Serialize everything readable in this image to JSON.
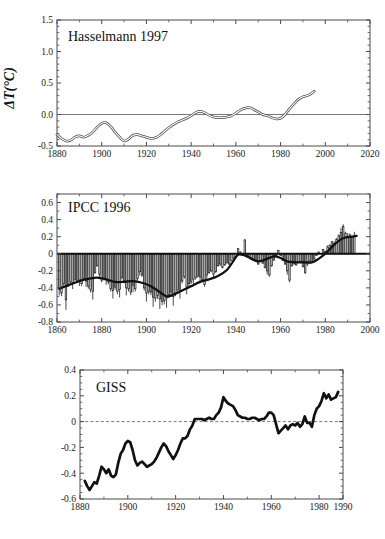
{
  "figure": {
    "background": "#ffffff",
    "panel_count": 3
  },
  "chart_data": [
    {
      "type": "line",
      "id": "hasselmann",
      "title": "Hasselmann 1997",
      "xlabel": "",
      "ylabel": "ΔT(°C)",
      "xlim": [
        1880,
        2020
      ],
      "ylim": [
        -0.5,
        1.5
      ],
      "xticks": [
        1880,
        1900,
        1920,
        1940,
        1960,
        1980,
        2000,
        2020
      ],
      "xtick_labels": [
        "1880",
        "1900",
        "1920",
        "1940",
        "1960",
        "1980",
        "2000",
        "2020"
      ],
      "yticks": [
        -0.5,
        0.0,
        0.5,
        1.0,
        1.5
      ],
      "ytick_labels": [
        "-0.5",
        "0.0",
        "0.5",
        "1.0",
        "1.5"
      ],
      "grid": false,
      "zero_line": true,
      "zero_line_style": "solid",
      "line_style": "hollow-double",
      "x": [
        1880,
        1882,
        1884,
        1886,
        1888,
        1890,
        1892,
        1894,
        1896,
        1898,
        1900,
        1902,
        1904,
        1906,
        1908,
        1910,
        1912,
        1914,
        1916,
        1918,
        1920,
        1922,
        1924,
        1926,
        1928,
        1930,
        1932,
        1934,
        1936,
        1938,
        1940,
        1942,
        1944,
        1946,
        1948,
        1950,
        1952,
        1954,
        1956,
        1958,
        1960,
        1962,
        1964,
        1966,
        1968,
        1970,
        1972,
        1974,
        1976,
        1978,
        1980,
        1982,
        1984,
        1986,
        1988,
        1990,
        1992,
        1994,
        1995
      ],
      "y": [
        -0.32,
        -0.38,
        -0.42,
        -0.41,
        -0.36,
        -0.34,
        -0.36,
        -0.33,
        -0.28,
        -0.2,
        -0.14,
        -0.13,
        -0.19,
        -0.28,
        -0.36,
        -0.42,
        -0.39,
        -0.33,
        -0.32,
        -0.34,
        -0.36,
        -0.38,
        -0.37,
        -0.33,
        -0.27,
        -0.21,
        -0.16,
        -0.12,
        -0.09,
        -0.06,
        -0.02,
        0.03,
        0.05,
        0.03,
        -0.01,
        -0.04,
        -0.05,
        -0.05,
        -0.04,
        -0.02,
        0.02,
        0.07,
        0.1,
        0.11,
        0.08,
        0.04,
        0.0,
        -0.02,
        -0.05,
        -0.07,
        -0.06,
        0.0,
        0.09,
        0.17,
        0.24,
        0.28,
        0.3,
        0.34,
        0.37
      ]
    },
    {
      "type": "bar",
      "id": "ipcc",
      "title": "IPCC 1996",
      "xlabel": "",
      "ylabel": "",
      "xlim": [
        1860,
        2000
      ],
      "ylim": [
        -0.8,
        0.7
      ],
      "xticks": [
        1860,
        1880,
        1900,
        1920,
        1940,
        1960,
        1980,
        2000
      ],
      "xtick_labels": [
        "1860",
        "1880",
        "1900",
        "1920",
        "1940",
        "1960",
        "1980",
        "2000"
      ],
      "yticks": [
        -0.8,
        -0.6,
        -0.4,
        -0.2,
        0,
        0.2,
        0.4,
        0.6
      ],
      "ytick_labels": [
        "-0.8",
        "-0.6",
        "-0.4",
        "-0.2",
        "0",
        "0.2",
        "0.4",
        "0.6"
      ],
      "grid": false,
      "zero_line": true,
      "zero_line_style": "heavy-solid",
      "bar_color": "#ffffff",
      "bar_edge_color": "#2b2b2b",
      "series": [
        {
          "name": "Annual anomaly",
          "x_start": 1861,
          "x_end": 1994,
          "values": [
            -0.4,
            -0.46,
            -0.35,
            -0.54,
            -0.36,
            -0.33,
            -0.34,
            -0.3,
            -0.32,
            -0.31,
            -0.35,
            -0.29,
            -0.32,
            -0.38,
            -0.42,
            -0.44,
            -0.22,
            -0.14,
            -0.24,
            -0.31,
            -0.29,
            -0.3,
            -0.33,
            -0.41,
            -0.43,
            -0.39,
            -0.44,
            -0.42,
            -0.28,
            -0.32,
            -0.4,
            -0.41,
            -0.45,
            -0.37,
            -0.41,
            -0.29,
            -0.21,
            -0.25,
            -0.4,
            -0.46,
            -0.44,
            -0.45,
            -0.51,
            -0.52,
            -0.49,
            -0.53,
            -0.56,
            -0.55,
            -0.52,
            -0.48,
            -0.45,
            -0.5,
            -0.46,
            -0.42,
            -0.43,
            -0.32,
            -0.27,
            -0.39,
            -0.35,
            -0.33,
            -0.3,
            -0.28,
            -0.26,
            -0.27,
            -0.3,
            -0.36,
            -0.25,
            -0.22,
            -0.2,
            -0.24,
            -0.21,
            -0.14,
            -0.12,
            -0.16,
            -0.13,
            -0.1,
            -0.12,
            -0.08,
            -0.05,
            0.0,
            0.06,
            0.02,
            -0.01,
            0.16,
            -0.02,
            -0.03,
            -0.05,
            -0.07,
            -0.09,
            -0.12,
            -0.08,
            -0.11,
            -0.16,
            -0.2,
            -0.25,
            -0.14,
            -0.07,
            -0.03,
            0.04,
            -0.02,
            -0.08,
            -0.12,
            -0.2,
            -0.31,
            -0.14,
            -0.11,
            -0.13,
            -0.1,
            -0.09,
            -0.15,
            -0.22,
            -0.12,
            -0.08,
            -0.1,
            -0.06,
            -0.02,
            0.02,
            0.0,
            0.05,
            0.03,
            0.08,
            0.1,
            0.14,
            0.12,
            0.17,
            0.21,
            0.25,
            0.32,
            0.24,
            0.2,
            0.22,
            0.19,
            0.21
          ]
        },
        {
          "name": "Smoothed trend",
          "type": "line",
          "x": [
            1861,
            1865,
            1870,
            1875,
            1878,
            1882,
            1886,
            1890,
            1894,
            1898,
            1902,
            1906,
            1909,
            1912,
            1916,
            1920,
            1924,
            1928,
            1932,
            1936,
            1939,
            1941,
            1944,
            1947,
            1950,
            1953,
            1957,
            1960,
            1963,
            1966,
            1970,
            1974,
            1977,
            1980,
            1983,
            1986,
            1989,
            1992,
            1994
          ],
          "values": [
            -0.41,
            -0.37,
            -0.32,
            -0.29,
            -0.28,
            -0.3,
            -0.33,
            -0.33,
            -0.32,
            -0.34,
            -0.38,
            -0.45,
            -0.5,
            -0.48,
            -0.43,
            -0.38,
            -0.33,
            -0.3,
            -0.26,
            -0.19,
            -0.08,
            -0.01,
            -0.02,
            -0.06,
            -0.09,
            -0.07,
            -0.03,
            -0.05,
            -0.09,
            -0.1,
            -0.1,
            -0.1,
            -0.06,
            0.0,
            0.08,
            0.15,
            0.19,
            0.2,
            0.21
          ]
        }
      ]
    },
    {
      "type": "line",
      "id": "giss",
      "title": "GISS",
      "xlabel": "",
      "ylabel": "",
      "xlim": [
        1880,
        1990
      ],
      "ylim": [
        -0.6,
        0.4
      ],
      "xticks": [
        1880,
        1900,
        1920,
        1940,
        1960,
        1980,
        1990
      ],
      "xtick_labels": [
        "1880",
        "1900",
        "1920",
        "1940",
        "1960",
        "1980",
        "1990"
      ],
      "yticks": [
        -0.6,
        -0.4,
        -0.2,
        0,
        0.2,
        0.4
      ],
      "ytick_labels": [
        "-0.6",
        "-0.4",
        "-0.2",
        "0",
        "0.2",
        "0.4"
      ],
      "grid": false,
      "zero_line": true,
      "zero_line_style": "dashed",
      "line_style": "thick-solid",
      "x": [
        1882,
        1883,
        1884,
        1885,
        1886,
        1887,
        1888,
        1889,
        1890,
        1891,
        1892,
        1893,
        1894,
        1895,
        1896,
        1897,
        1898,
        1899,
        1900,
        1901,
        1902,
        1903,
        1904,
        1905,
        1906,
        1907,
        1908,
        1909,
        1910,
        1911,
        1912,
        1913,
        1914,
        1915,
        1916,
        1917,
        1918,
        1919,
        1920,
        1921,
        1922,
        1923,
        1924,
        1925,
        1926,
        1927,
        1928,
        1929,
        1930,
        1931,
        1932,
        1933,
        1934,
        1935,
        1936,
        1937,
        1938,
        1939,
        1940,
        1941,
        1942,
        1943,
        1944,
        1945,
        1946,
        1947,
        1948,
        1949,
        1950,
        1951,
        1952,
        1953,
        1954,
        1955,
        1956,
        1957,
        1958,
        1959,
        1960,
        1961,
        1962,
        1963,
        1964,
        1965,
        1966,
        1967,
        1968,
        1969,
        1970,
        1971,
        1972,
        1973,
        1974,
        1975,
        1976,
        1977,
        1978,
        1979,
        1980,
        1981,
        1982,
        1983,
        1984,
        1985,
        1986,
        1987,
        1988
      ],
      "y": [
        -0.46,
        -0.5,
        -0.53,
        -0.5,
        -0.47,
        -0.48,
        -0.42,
        -0.35,
        -0.37,
        -0.4,
        -0.37,
        -0.42,
        -0.43,
        -0.41,
        -0.32,
        -0.25,
        -0.22,
        -0.17,
        -0.15,
        -0.16,
        -0.22,
        -0.3,
        -0.34,
        -0.32,
        -0.31,
        -0.33,
        -0.35,
        -0.34,
        -0.33,
        -0.31,
        -0.28,
        -0.24,
        -0.2,
        -0.17,
        -0.19,
        -0.23,
        -0.26,
        -0.29,
        -0.26,
        -0.22,
        -0.17,
        -0.13,
        -0.13,
        -0.11,
        -0.06,
        -0.03,
        0.02,
        0.02,
        0.02,
        0.02,
        0.01,
        0.02,
        0.03,
        0.02,
        0.02,
        0.05,
        0.07,
        0.11,
        0.19,
        0.16,
        0.14,
        0.13,
        0.12,
        0.09,
        0.05,
        0.04,
        0.03,
        0.03,
        0.02,
        0.02,
        0.03,
        0.03,
        0.02,
        0.01,
        0.02,
        0.02,
        0.04,
        0.07,
        0.07,
        0.05,
        -0.02,
        -0.09,
        -0.07,
        -0.05,
        -0.03,
        -0.06,
        -0.03,
        -0.02,
        -0.03,
        -0.01,
        -0.04,
        -0.02,
        0.04,
        -0.01,
        -0.01,
        -0.04,
        0.05,
        0.1,
        0.12,
        0.16,
        0.22,
        0.18,
        0.21,
        0.17,
        0.18,
        0.19,
        0.23,
        0.25
      ]
    }
  ]
}
